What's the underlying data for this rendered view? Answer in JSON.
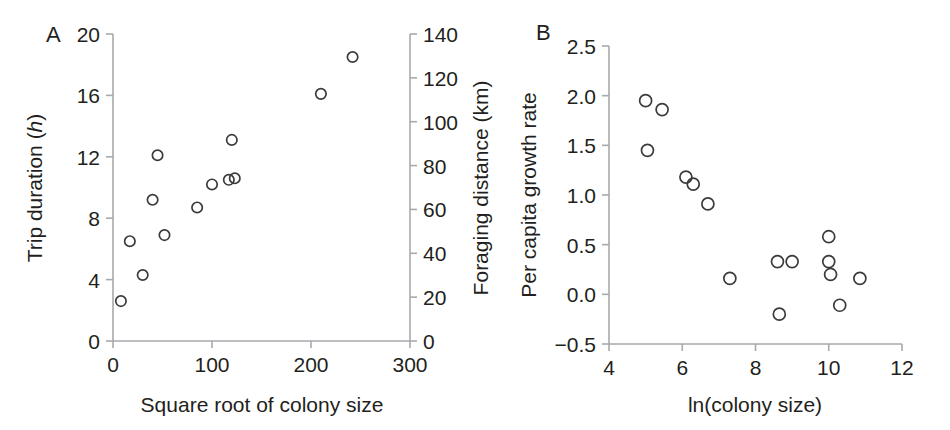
{
  "figure": {
    "panels": [
      {
        "letter": "A",
        "name": "trip-duration-vs-colony-size"
      },
      {
        "letter": "B",
        "name": "growth-rate-vs-ln-colony-size"
      }
    ]
  },
  "panel_a": {
    "letter": "A",
    "xlabel": "Square root of colony size",
    "ylabel_left_prefix": "Trip duration (",
    "ylabel_left_italic": "h",
    "ylabel_left_suffix": ")",
    "ylabel_right": "Foraging distance (km)",
    "xticks": [
      "0",
      "100",
      "200",
      "300"
    ],
    "yticks_left": [
      "0",
      "4",
      "8",
      "12",
      "16",
      "20"
    ],
    "yticks_right": [
      "0",
      "20",
      "40",
      "60",
      "80",
      "100",
      "120",
      "140"
    ]
  },
  "panel_b": {
    "letter": "B",
    "xlabel": "ln(colony size)",
    "ylabel": "Per capita growth rate",
    "xticks": [
      "4",
      "6",
      "8",
      "10",
      "12"
    ],
    "yticks": [
      "−0.5",
      "0.0",
      "0.5",
      "1.0",
      "1.5",
      "2.0",
      "2.5"
    ]
  },
  "chart_data": [
    {
      "type": "scatter",
      "panel": "A",
      "title": "",
      "xlabel": "Square root of colony size",
      "ylabel": "Trip duration (h)",
      "ylabel_secondary": "Foraging distance (km)",
      "xlim": [
        0,
        300
      ],
      "ylim": [
        0,
        20
      ],
      "ylim_secondary": [
        0,
        140
      ],
      "xticks": [
        0,
        100,
        200,
        300
      ],
      "yticks": [
        0,
        4,
        8,
        12,
        16,
        20
      ],
      "yticks_secondary": [
        0,
        20,
        40,
        60,
        80,
        100,
        120,
        140
      ],
      "grid": false,
      "legend": false,
      "marker": "open-circle",
      "points": [
        {
          "x": 8,
          "y": 2.6
        },
        {
          "x": 17,
          "y": 6.5
        },
        {
          "x": 30,
          "y": 4.3
        },
        {
          "x": 40,
          "y": 9.2
        },
        {
          "x": 45,
          "y": 12.1
        },
        {
          "x": 52,
          "y": 6.9
        },
        {
          "x": 85,
          "y": 8.7
        },
        {
          "x": 100,
          "y": 10.2
        },
        {
          "x": 117,
          "y": 10.5
        },
        {
          "x": 123,
          "y": 10.6
        },
        {
          "x": 120,
          "y": 13.1
        },
        {
          "x": 210,
          "y": 16.1
        },
        {
          "x": 242,
          "y": 18.5
        }
      ]
    },
    {
      "type": "scatter",
      "panel": "B",
      "title": "",
      "xlabel": "ln(colony size)",
      "ylabel": "Per capita growth rate",
      "xlim": [
        4,
        12
      ],
      "ylim": [
        -0.5,
        2.5
      ],
      "xticks": [
        4,
        6,
        8,
        10,
        12
      ],
      "yticks": [
        -0.5,
        0.0,
        0.5,
        1.0,
        1.5,
        2.0,
        2.5
      ],
      "grid": false,
      "legend": false,
      "marker": "open-circle",
      "points": [
        {
          "x": 5.0,
          "y": 1.95
        },
        {
          "x": 5.05,
          "y": 1.45
        },
        {
          "x": 5.45,
          "y": 1.86
        },
        {
          "x": 6.1,
          "y": 1.18
        },
        {
          "x": 6.3,
          "y": 1.11
        },
        {
          "x": 6.7,
          "y": 0.91
        },
        {
          "x": 7.3,
          "y": 0.16
        },
        {
          "x": 8.6,
          "y": 0.33
        },
        {
          "x": 8.65,
          "y": -0.2
        },
        {
          "x": 9.0,
          "y": 0.33
        },
        {
          "x": 10.0,
          "y": 0.58
        },
        {
          "x": 10.0,
          "y": 0.33
        },
        {
          "x": 10.05,
          "y": 0.2
        },
        {
          "x": 10.3,
          "y": -0.11
        },
        {
          "x": 10.85,
          "y": 0.16
        }
      ]
    }
  ]
}
